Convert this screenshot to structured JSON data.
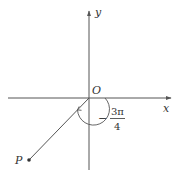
{
  "diagram": {
    "type": "angle-in-standard-position",
    "axes": {
      "x_label": "x",
      "y_label": "y",
      "origin_label": "O"
    },
    "point": {
      "label": "P",
      "quadrant": "III"
    },
    "angle": {
      "sign": "−",
      "numerator": "3π",
      "denominator": "4",
      "text": "−3π/4",
      "direction": "clockwise"
    },
    "colors": {
      "line": "#555555",
      "text": "#333333",
      "background": "#ffffff"
    }
  }
}
